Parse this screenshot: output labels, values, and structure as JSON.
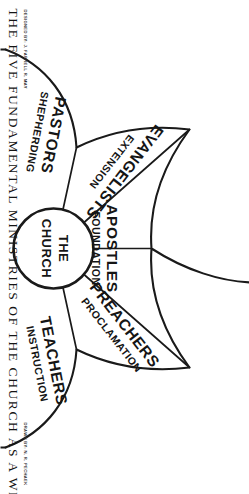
{
  "document": {
    "caption": "THE FIVE FUNDAMENTAL MINISTRIES OF THE CHURCH AS A WHOLE",
    "credit_left": "DESIGNED  BY: J. FARRELL R. MAY",
    "credit_right": "DRAWN  BY: N. R. PECHAEK"
  },
  "hub": {
    "line1": "THE",
    "line2": "CHURCH"
  },
  "panels": [
    {
      "title": "APOSTLES",
      "subtitle": "FOUNDATION"
    },
    {
      "title": "PREACHERS",
      "subtitle": "PROCLAMATION"
    },
    {
      "title": "TEACHERS",
      "subtitle": "INSTRUCTION"
    },
    {
      "title": "EVANGELISTS",
      "subtitle": "EXTENSION"
    },
    {
      "title": "PASTORS",
      "subtitle": "SHEPHERDING"
    }
  ],
  "colors": {
    "ink": "#1a1a1a",
    "paper": "#ffffff"
  }
}
